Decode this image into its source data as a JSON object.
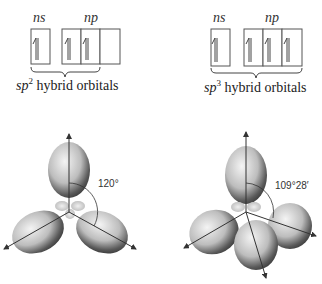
{
  "left_panel": {
    "s_label": "ns",
    "p_label": "np",
    "s_boxes": 1,
    "p_boxes": 3,
    "filled_p": 2,
    "caption_prefix": "sp",
    "caption_sup": "2",
    "caption_suffix": " hybrid orbitals",
    "angle": "120°"
  },
  "right_panel": {
    "s_label": "ns",
    "p_label": "np",
    "s_boxes": 1,
    "p_boxes": 3,
    "filled_p": 3,
    "caption_prefix": "sp",
    "caption_sup": "3",
    "caption_suffix": " hybrid orbitals",
    "angle": "109°28′"
  },
  "colors": {
    "lobe_light": "#e8e8e8",
    "lobe_dark": "#3a3a3a",
    "line": "#333333"
  }
}
